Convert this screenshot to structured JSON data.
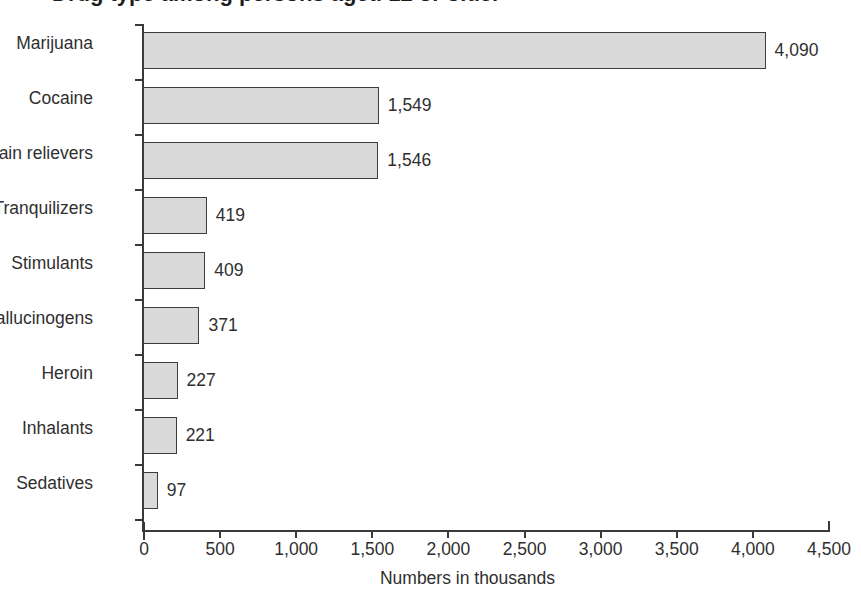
{
  "chart_data": {
    "type": "bar",
    "orientation": "horizontal",
    "title": "",
    "subtitle": "",
    "xlabel": "Numbers in thousands",
    "ylabel": "",
    "xlim": [
      0,
      4500
    ],
    "xticks": [
      0,
      500,
      1000,
      1500,
      2000,
      2500,
      3000,
      3500,
      4000,
      4500
    ],
    "xtick_labels": [
      "0",
      "500",
      "1,000",
      "1,500",
      "2,000",
      "2,500",
      "3,000",
      "3,500",
      "4,000",
      "4,500"
    ],
    "grid": false,
    "legend": false,
    "categories": [
      "Marijuana",
      "Cocaine",
      "Pain relievers",
      "Tranquilizers",
      "Stimulants",
      "Hallucinogens",
      "Heroin",
      "Inhalants",
      "Sedatives"
    ],
    "values": [
      4090,
      1549,
      1546,
      419,
      409,
      371,
      227,
      221,
      97
    ],
    "value_labels": [
      "4,090",
      "1,549",
      "1,546",
      "419",
      "409",
      "371",
      "227",
      "221",
      "97"
    ],
    "bar_fill_color": "#d9d9d9",
    "bar_border_color": "#3d3d3d",
    "axis_color": "#3a3a3a",
    "text_color": "#2f2f2f"
  },
  "title_fragment": {
    "text": "Drug type among persons aged 12 or older"
  }
}
